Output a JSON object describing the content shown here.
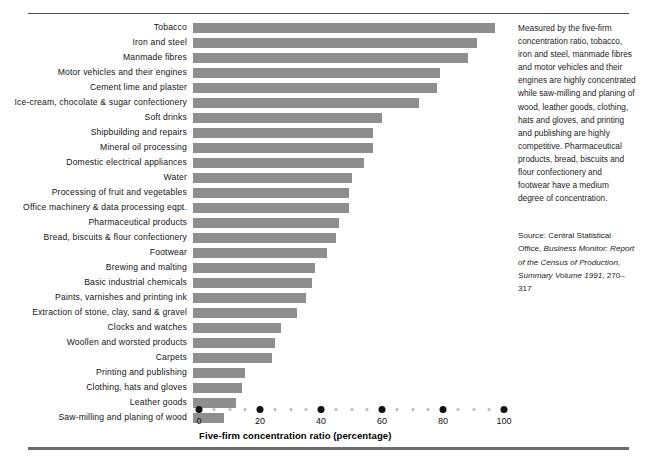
{
  "chart_data": {
    "type": "bar",
    "orientation": "horizontal",
    "title": "",
    "xlabel": "Five-firm concentration ratio (percentage)",
    "ylabel": "",
    "xlim": [
      0,
      100
    ],
    "xticks": [
      0,
      20,
      40,
      60,
      80,
      100
    ],
    "grid": false,
    "legend": null,
    "bar_color": "#8e8e8e",
    "categories": [
      "Tobacco",
      "Iron and steel",
      "Manmade fibres",
      "Motor vehicles and their engines",
      "Cement lime and plaster",
      "Ice-cream, chocolate & sugar confectionery",
      "Soft drinks",
      "Shipbuilding and repairs",
      "Mineral oil processing",
      "Domestic electrical appliances",
      "Water",
      "Processing of fruit and vegetables",
      "Office machinery & data processing eqpt.",
      "Pharmaceutical products",
      "Bread, biscuits & flour confectionery",
      "Footwear",
      "Brewing and malting",
      "Basic industrial chemicals",
      "Paints, varnishes and printing ink",
      "Extraction of stone, clay, sand & gravel",
      "Clocks and watches",
      "Woollen and worsted products",
      "Carpets",
      "Printing and publishing",
      "Clothing, hats and gloves",
      "Leather goods",
      "Saw-milling and planing of wood"
    ],
    "values": [
      99,
      93,
      90,
      81,
      80,
      74,
      62,
      59,
      59,
      56,
      52,
      51,
      51,
      48,
      47,
      44,
      40,
      39,
      37,
      34,
      29,
      27,
      26,
      17,
      16,
      14,
      10
    ]
  },
  "axis": {
    "tick_labels": [
      "0",
      "20",
      "40",
      "60",
      "80",
      "100"
    ],
    "title": "Five-firm concentration ratio (percentage)"
  },
  "side_panel": {
    "commentary": "Measured by the five-firm concentration ratio, tobacco, iron and steel, manmade fibres and motor vehicles and their engines are highly concentrated while saw-milling and planing of wood, leather goods, clothing, hats and gloves, and printing and publishing are highly competitive. Pharmaceutical products, bread, biscuits and flour confectionery and footwear have a medium degree of concentration.",
    "source_prefix": "Source: Central Statistical Office,",
    "source_italic": "Business Monitor: Report of the Census of Production, Summary Volume 1991",
    "source_suffix": ", 270–317"
  }
}
